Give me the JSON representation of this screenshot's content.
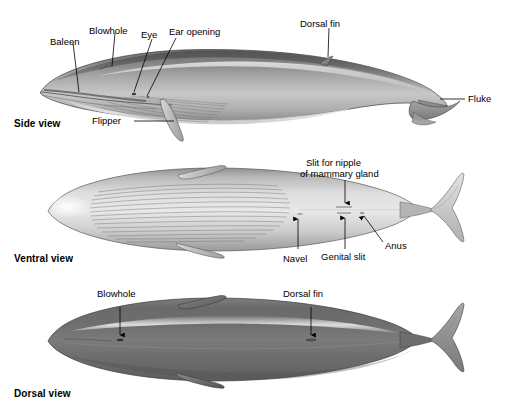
{
  "figure": {
    "background_color": "#ffffff",
    "ink_color": "#000000",
    "body_tone_dark": "#5d5d5d",
    "body_tone_mid": "#8e8e8e",
    "body_tone_light": "#d8d8d8",
    "body_tone_highlight": "#f2f2f2"
  },
  "views": [
    {
      "id": "side",
      "caption": "Side view",
      "labels": [
        {
          "id": "baleen",
          "text": "Baleen",
          "leader": "line"
        },
        {
          "id": "blowhole",
          "text": "Blowhole",
          "leader": "line"
        },
        {
          "id": "eye",
          "text": "Eye",
          "leader": "line"
        },
        {
          "id": "ear-opening",
          "text": "Ear opening",
          "leader": "line"
        },
        {
          "id": "dorsal-fin",
          "text": "Dorsal fin",
          "leader": "line"
        },
        {
          "id": "fluke",
          "text": "Fluke",
          "leader": "line"
        },
        {
          "id": "flipper",
          "text": "Flipper",
          "leader": "line"
        }
      ]
    },
    {
      "id": "ventral",
      "caption": "Ventral view",
      "labels": [
        {
          "id": "slit-for-nipple",
          "text": "Slit for nipple",
          "leader": "arrow"
        },
        {
          "id": "of-mammary-gland",
          "text": "of mammary gland",
          "leader": "none"
        },
        {
          "id": "navel",
          "text": "Navel",
          "leader": "arrow"
        },
        {
          "id": "genital-slit",
          "text": "Genital slit",
          "leader": "arrow"
        },
        {
          "id": "anus",
          "text": "Anus",
          "leader": "arrow"
        }
      ]
    },
    {
      "id": "dorsal",
      "caption": "Dorsal view",
      "labels": [
        {
          "id": "blowhole",
          "text": "Blowhole",
          "leader": "arrow"
        },
        {
          "id": "dorsal-fin",
          "text": "Dorsal fin",
          "leader": "arrow"
        }
      ]
    }
  ]
}
